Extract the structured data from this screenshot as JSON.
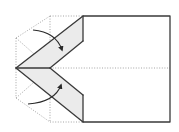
{
  "diagram": {
    "type": "origami-fold-step",
    "colors": {
      "background": "#ffffff",
      "solid_line": "#3a3a3a",
      "dotted_line": "#9a9a9a",
      "flap_fill": "#ebebeb",
      "arrow": "#2a2a2a"
    },
    "shapes": {
      "body_rect": {
        "x1": 83,
        "y1": 16,
        "x2": 170,
        "y2": 122
      },
      "apex": {
        "x": 16,
        "y": 68
      },
      "center_point": {
        "x": 50,
        "y": 68
      },
      "center_crease_dotted": {
        "x1": 50,
        "y1": 68,
        "x2": 170,
        "y2": 68
      }
    },
    "flaps": [
      {
        "name": "upper-flap",
        "points": "16,68 83,16 83,41 50,68"
      },
      {
        "name": "lower-flap",
        "points": "16,68 50,68 83,95 83,122"
      }
    ],
    "arrows": [
      {
        "name": "upper-fold-arrow",
        "direction": "down-right",
        "path": "M33,30 Q56,32 62,50"
      },
      {
        "name": "lower-fold-arrow",
        "direction": "up-right",
        "path": "M28,104 Q55,102 61,85"
      }
    ]
  }
}
